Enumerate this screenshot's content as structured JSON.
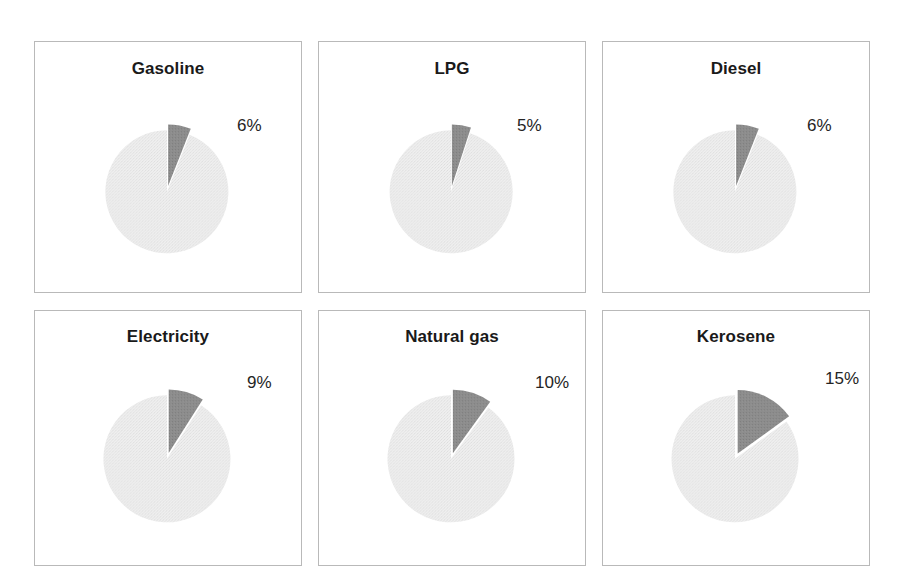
{
  "figure": {
    "background_color": "#ffffff",
    "panel_border_color": "#b9b9b9",
    "slice_highlight_color": "#8a8a8a",
    "slice_remainder_color": "#e6e6e6"
  },
  "chart_data": [
    {
      "type": "pie",
      "title": "Gasoline",
      "categories": [
        "Share",
        "Remainder"
      ],
      "values": [
        6,
        94
      ],
      "data_labels": [
        "6%",
        ""
      ],
      "exploded_slice": 0,
      "start_angle_deg": 0,
      "legend": "none",
      "grid": false
    },
    {
      "type": "pie",
      "title": "LPG",
      "categories": [
        "Share",
        "Remainder"
      ],
      "values": [
        5,
        95
      ],
      "data_labels": [
        "5%",
        ""
      ],
      "exploded_slice": 0,
      "start_angle_deg": 0,
      "legend": "none",
      "grid": false
    },
    {
      "type": "pie",
      "title": "Diesel",
      "categories": [
        "Share",
        "Remainder"
      ],
      "values": [
        6,
        94
      ],
      "data_labels": [
        "6%",
        ""
      ],
      "exploded_slice": 0,
      "start_angle_deg": 0,
      "legend": "none",
      "grid": false
    },
    {
      "type": "pie",
      "title": "Electricity",
      "categories": [
        "Share",
        "Remainder"
      ],
      "values": [
        9,
        91
      ],
      "data_labels": [
        "9%",
        ""
      ],
      "exploded_slice": 0,
      "start_angle_deg": 0,
      "legend": "none",
      "grid": false
    },
    {
      "type": "pie",
      "title": "Natural gas",
      "categories": [
        "Share",
        "Remainder"
      ],
      "values": [
        10,
        90
      ],
      "data_labels": [
        "10%",
        ""
      ],
      "exploded_slice": 0,
      "start_angle_deg": 0,
      "legend": "none",
      "grid": false
    },
    {
      "type": "pie",
      "title": "Kerosene",
      "categories": [
        "Share",
        "Remainder"
      ],
      "values": [
        15,
        85
      ],
      "data_labels": [
        "15%",
        ""
      ],
      "exploded_slice": 0,
      "start_angle_deg": 0,
      "legend": "none",
      "grid": false
    }
  ],
  "panels": [
    {
      "title": "Gasoline",
      "percent_label": "6%",
      "label_x": 202,
      "label_y": 74
    },
    {
      "title": "LPG",
      "percent_label": "5%",
      "label_x": 198,
      "label_y": 74
    },
    {
      "title": "Diesel",
      "percent_label": "6%",
      "label_x": 204,
      "label_y": 74
    },
    {
      "title": "Electricity",
      "percent_label": "9%",
      "label_x": 212,
      "label_y": 62
    },
    {
      "title": "Natural gas",
      "percent_label": "10%",
      "label_x": 216,
      "label_y": 62
    },
    {
      "title": "Kerosene",
      "percent_label": "15%",
      "label_x": 222,
      "label_y": 58
    }
  ]
}
